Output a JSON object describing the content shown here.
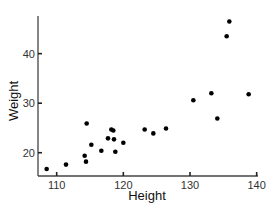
{
  "chart_data": {
    "type": "scatter",
    "title": "",
    "xlabel": "Height",
    "ylabel": "Weight",
    "xlim": [
      107.2,
      140.2
    ],
    "ylim": [
      15.3,
      47.6
    ],
    "xticks": [
      110,
      120,
      130,
      140
    ],
    "yticks": [
      20,
      30,
      40
    ],
    "grid": false,
    "legend": null,
    "marker_color": "#000000",
    "points": [
      {
        "x": 108.5,
        "y": 16.7
      },
      {
        "x": 111.4,
        "y": 17.6
      },
      {
        "x": 114.2,
        "y": 19.4
      },
      {
        "x": 114.4,
        "y": 18.2
      },
      {
        "x": 114.5,
        "y": 25.9
      },
      {
        "x": 115.2,
        "y": 21.6
      },
      {
        "x": 116.7,
        "y": 20.4
      },
      {
        "x": 117.7,
        "y": 22.9
      },
      {
        "x": 118.2,
        "y": 24.7
      },
      {
        "x": 118.5,
        "y": 24.5
      },
      {
        "x": 118.6,
        "y": 22.7
      },
      {
        "x": 118.8,
        "y": 20.2
      },
      {
        "x": 120.0,
        "y": 22.0
      },
      {
        "x": 123.2,
        "y": 24.7
      },
      {
        "x": 124.5,
        "y": 23.9
      },
      {
        "x": 126.4,
        "y": 24.9
      },
      {
        "x": 130.5,
        "y": 30.6
      },
      {
        "x": 133.2,
        "y": 32.0
      },
      {
        "x": 134.1,
        "y": 26.9
      },
      {
        "x": 135.5,
        "y": 43.5
      },
      {
        "x": 135.9,
        "y": 46.5
      },
      {
        "x": 138.8,
        "y": 31.8
      }
    ]
  }
}
